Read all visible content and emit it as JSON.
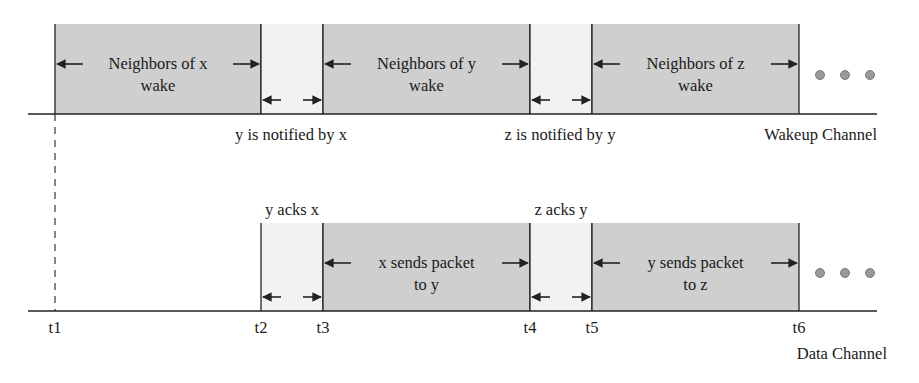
{
  "colors": {
    "active_fill": "#cfcfcf",
    "gap_fill": "#f2f2f2",
    "line": "#222222",
    "dot": "#9a9a9a"
  },
  "wakeup_channel": {
    "label": "Wakeup Channel",
    "segments": [
      {
        "type": "active",
        "x0": 55,
        "x1": 261,
        "line1": "Neighbors of x",
        "line2": "wake"
      },
      {
        "type": "gap",
        "x0": 261,
        "x1": 323
      },
      {
        "type": "active",
        "x0": 323,
        "x1": 530,
        "line1": "Neighbors of y",
        "line2": "wake"
      },
      {
        "type": "gap",
        "x0": 530,
        "x1": 592
      },
      {
        "type": "active",
        "x0": 592,
        "x1": 799,
        "line1": "Neighbors of z",
        "line2": "wake"
      }
    ],
    "notes": [
      {
        "text": "y is notified by x",
        "x": 291
      },
      {
        "text": "z is notified by y",
        "x": 560
      }
    ]
  },
  "data_channel": {
    "label": "Data Channel",
    "segments": [
      {
        "type": "gap",
        "x0": 261,
        "x1": 323,
        "top_label": "y acks x"
      },
      {
        "type": "active",
        "x0": 323,
        "x1": 530,
        "line1": "x sends packet",
        "line2": "to y"
      },
      {
        "type": "gap",
        "x0": 530,
        "x1": 592,
        "top_label": "z acks y"
      },
      {
        "type": "active",
        "x0": 592,
        "x1": 799,
        "line1": "y sends packet",
        "line2": "to z"
      }
    ]
  },
  "time_marks": [
    {
      "label": "t1",
      "x": 55
    },
    {
      "label": "t2",
      "x": 261
    },
    {
      "label": "t3",
      "x": 323
    },
    {
      "label": "t4",
      "x": 530
    },
    {
      "label": "t5",
      "x": 592
    },
    {
      "label": "t6",
      "x": 799
    }
  ],
  "continuation": "•••"
}
